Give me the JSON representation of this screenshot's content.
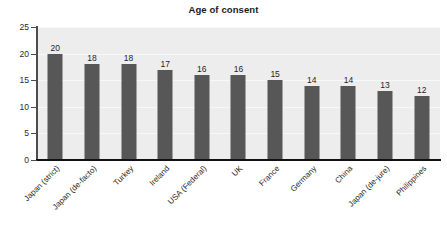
{
  "chart_data": {
    "type": "bar",
    "title": "Age of consent",
    "xlabel": "",
    "ylabel": "",
    "ylim": [
      0,
      25
    ],
    "yticks": [
      0,
      5,
      10,
      15,
      20,
      25
    ],
    "grid": true,
    "legend": false,
    "orientation": "vertical",
    "data_labels_shown": true,
    "categories": [
      "Japan (strict)",
      "Japan (de-facto)",
      "Turkey",
      "Ireland",
      "USA (Federal)",
      "UK",
      "France",
      "Germany",
      "China",
      "Japan (de-jure)",
      "Philippines"
    ],
    "values": [
      20,
      18,
      18,
      17,
      16,
      16,
      15,
      14,
      14,
      13,
      12
    ],
    "colors": {
      "bar": "#575757",
      "plot_background": "#ededed",
      "gridline": "#f8f8f8",
      "axis": "#111111",
      "text": "#1f1f1f",
      "page_background": "#ffffff"
    }
  }
}
